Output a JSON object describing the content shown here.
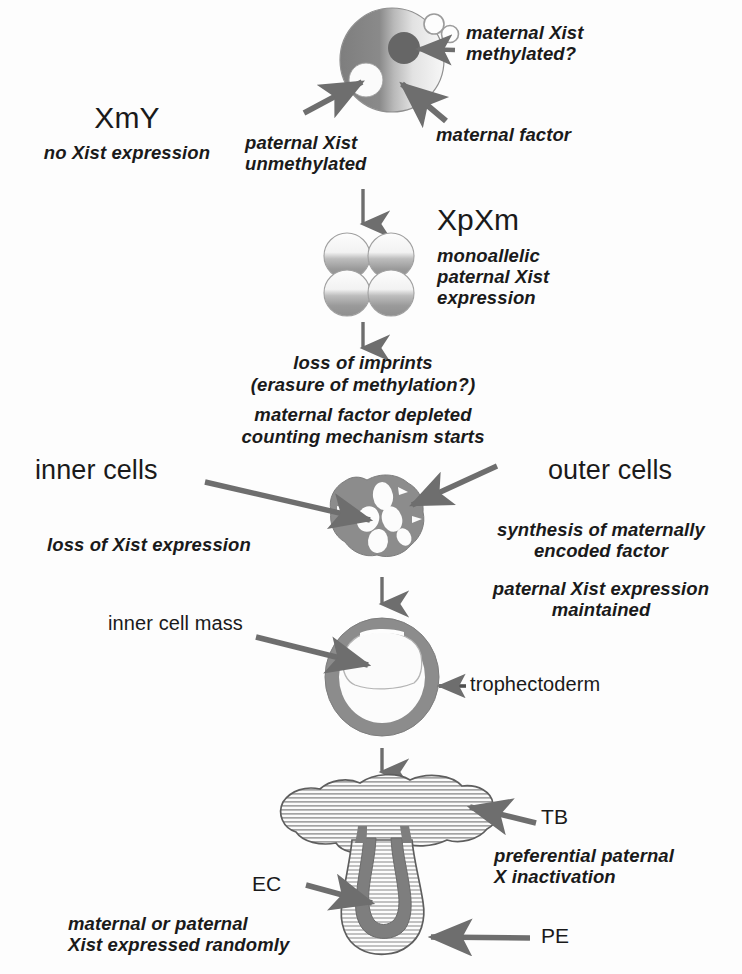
{
  "diagram": {
    "background_color": "#fdfdfd",
    "ink_color": "#1a1a1a",
    "cell_gray": "#8c8c8c",
    "arrow_gray": "#6e6e6e"
  },
  "stage_zygote": {
    "genotype_label": "XmY",
    "genotype_note": "no Xist expression",
    "annotation_maternal": "maternal Xist\nmethylated?",
    "annotation_paternal": "paternal Xist\nunmethylated",
    "annotation_factor": "maternal factor"
  },
  "stage_four_cell": {
    "genotype_label": "XpXm",
    "note": "monoallelic\npaternal Xist\nexpression"
  },
  "stage_imprint_loss": {
    "line1": "loss of imprints",
    "line2": "(erasure of methylation?)",
    "line3": "maternal factor depleted",
    "line4": "counting mechanism starts"
  },
  "stage_morula": {
    "label_left": "inner cells",
    "label_right": "outer cells",
    "note_left": "loss of Xist expression",
    "note_right_1": "synthesis of maternally\nencoded factor",
    "note_right_2": "paternal Xist expression\nmaintained"
  },
  "stage_blastocyst": {
    "label_icm": "inner cell mass",
    "label_trophectoderm": "trophectoderm"
  },
  "stage_egg_cylinder": {
    "label_tb": "TB",
    "label_ec": "EC",
    "label_pe": "PE",
    "note_right": "preferential paternal\nX inactivation",
    "note_left": "maternal or paternal\nXist expressed randomly"
  },
  "flow_arrows": {
    "count": 4,
    "direction": "downward",
    "description": "vertical progression arrows between developmental stages"
  }
}
